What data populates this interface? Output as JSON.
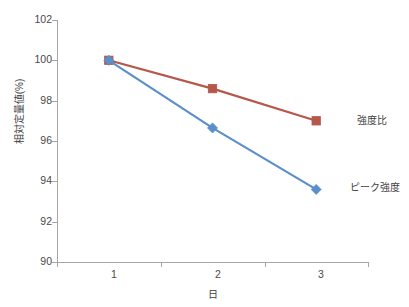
{
  "chart_data": {
    "type": "line",
    "title": "",
    "xlabel": "日",
    "ylabel": "相対定量値(%)",
    "x": [
      1,
      2,
      3
    ],
    "categories": [
      "1",
      "2",
      "3"
    ],
    "xtick_labels": [
      "1",
      "2",
      "3"
    ],
    "ytick_labels": [
      "90",
      "92",
      "94",
      "96",
      "98",
      "100",
      "102"
    ],
    "ytick_values": [
      90,
      92,
      94,
      96,
      98,
      100,
      102
    ],
    "ylim": [
      90,
      102
    ],
    "xlim": [
      0.5,
      3.5
    ],
    "grid": false,
    "legend_position": "inline-right",
    "series": [
      {
        "name": "強度比",
        "values": [
          100.0,
          98.6,
          97.0
        ],
        "color": "#b5584a",
        "marker": "square",
        "label_x": 357,
        "label_y": 112
      },
      {
        "name": "ピーク強度",
        "values": [
          100.0,
          96.65,
          93.6
        ],
        "color": "#5b8fc9",
        "marker": "diamond",
        "label_x": 350,
        "label_y": 179
      }
    ]
  },
  "axis": {
    "y_title": "相対定量値(%)",
    "x_title": "日"
  }
}
